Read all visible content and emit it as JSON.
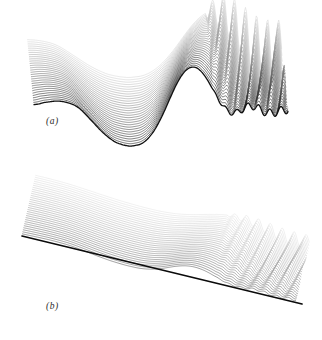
{
  "figure": {
    "name": "wave-evolution-waterfall-figure",
    "background_color": "#ffffff",
    "width": 322,
    "height": 340,
    "line_color_front": "#111111",
    "line_color_back": "#d8d8d8",
    "baseline_color": "#0a0a0a"
  },
  "panels": [
    {
      "id": "a",
      "label": "(a)",
      "label_x": 46,
      "label_y": 116,
      "view": "perspective-side",
      "description": "stacked wave profiles, front curve darkest"
    },
    {
      "id": "b",
      "label": "(b)",
      "label_x": 46,
      "label_y": 301,
      "view": "low-angle-top",
      "description": "same surface viewed near grazing incidence with dark straight baseline"
    }
  ],
  "chart_data": {
    "type": "line",
    "title": "",
    "subtitle": "",
    "xlabel": "",
    "ylabel": "",
    "grid": false,
    "legend_position": "none",
    "axes_visible": false,
    "tick_labels_x": [],
    "tick_labels_y": [],
    "annotations": [
      "(a)",
      "(b)"
    ],
    "series_count": 30,
    "x": [
      0.0,
      0.02,
      0.04,
      0.06,
      0.08,
      0.1,
      0.12,
      0.14,
      0.16,
      0.18,
      0.2,
      0.22,
      0.24,
      0.26,
      0.28,
      0.3,
      0.32,
      0.34,
      0.36,
      0.38,
      0.4,
      0.42,
      0.44,
      0.46,
      0.48,
      0.5,
      0.52,
      0.54,
      0.56,
      0.58,
      0.6,
      0.62,
      0.64,
      0.66,
      0.68,
      0.7,
      0.72,
      0.74,
      0.76,
      0.78,
      0.8,
      0.82,
      0.84,
      0.86,
      0.88,
      0.9,
      0.92,
      0.94,
      0.96,
      0.98,
      1.0
    ],
    "series": [
      {
        "name": "t = 0 (front, darkest)",
        "shift_index": 0,
        "values": [
          0.3,
          0.31,
          0.33,
          0.34,
          0.35,
          0.35,
          0.34,
          0.32,
          0.29,
          0.24,
          0.17,
          0.09,
          0.01,
          -0.07,
          -0.14,
          -0.2,
          -0.25,
          -0.28,
          -0.3,
          -0.31,
          -0.3,
          -0.28,
          -0.23,
          -0.15,
          -0.04,
          0.1,
          0.26,
          0.43,
          0.59,
          0.72,
          0.81,
          0.85,
          0.84,
          0.78,
          0.68,
          0.55,
          0.42,
          0.3,
          0.22,
          0.18,
          0.19,
          0.23,
          0.27,
          0.28,
          0.25,
          0.21,
          0.18,
          0.18,
          0.2,
          0.22,
          0.22
        ]
      },
      {
        "name": "t = 29 (back, lightest)",
        "shift_index": 29,
        "values": [
          0.3,
          0.31,
          0.33,
          0.34,
          0.35,
          0.35,
          0.34,
          0.32,
          0.29,
          0.24,
          0.17,
          0.09,
          0.01,
          -0.07,
          -0.14,
          -0.2,
          -0.25,
          -0.28,
          -0.3,
          -0.31,
          -0.3,
          -0.28,
          -0.23,
          -0.15,
          -0.04,
          0.1,
          0.26,
          0.43,
          0.59,
          0.72,
          0.81,
          0.85,
          0.84,
          0.78,
          0.68,
          0.55,
          0.42,
          0.3,
          0.22,
          0.18,
          0.19,
          0.23,
          0.27,
          0.28,
          0.25,
          0.21,
          0.18,
          0.18,
          0.2,
          0.22,
          0.22
        ]
      }
    ],
    "x_range": [
      0,
      1
    ],
    "y_range": [
      -0.4,
      1.0
    ],
    "waterfall_offset_x": 1.15,
    "waterfall_offset_y": -1.95,
    "oscillation_start_x": 0.7,
    "oscillation_wavenumber": 46,
    "oscillation_amplitude": 0.085,
    "oscillation_growth": 0.018
  }
}
